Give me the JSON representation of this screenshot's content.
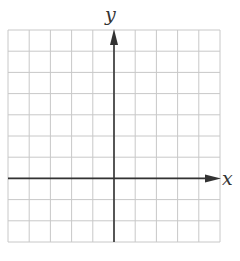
{
  "diagram": {
    "type": "coordinate-grid",
    "x_axis_label": "x",
    "y_axis_label": "y",
    "grid": {
      "columns": 10,
      "rows": 10,
      "left": 8,
      "top": 30,
      "cell": 21.2,
      "line_color": "#c8c8c8",
      "axis_color": "#333333"
    },
    "y_axis_column": 5,
    "x_axis_row": 7
  }
}
